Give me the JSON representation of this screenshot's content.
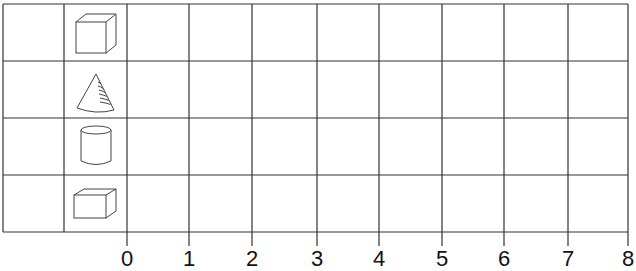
{
  "chart_data": {
    "type": "bar",
    "orientation": "horizontal",
    "title": "",
    "xlabel": "",
    "ylabel": "",
    "categories": [
      "cube",
      "cone",
      "cylinder",
      "rectangular prism"
    ],
    "category_icons": [
      "cube-icon",
      "cone-icon",
      "cylinder-icon",
      "rectangular-prism-icon"
    ],
    "values": [
      null,
      null,
      null,
      null
    ],
    "x_ticks": [
      "0",
      "1",
      "2",
      "3",
      "4",
      "5",
      "6",
      "7",
      "8"
    ],
    "xlim": [
      0,
      8
    ],
    "grid": true,
    "legend": null,
    "note": "Blank bar graph template; no bars filled in"
  },
  "colors": {
    "grid_line": "#333333",
    "icon_stroke": "#444444",
    "background": "#ffffff",
    "tick_label": "#111111"
  }
}
